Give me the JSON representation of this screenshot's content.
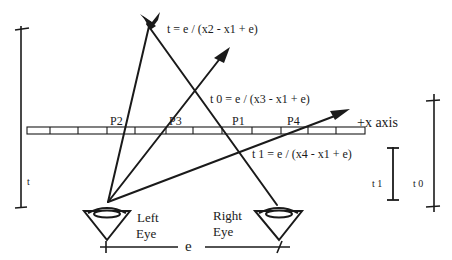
{
  "diagram": {
    "equations": {
      "t": "t = e / (x2 - x1 + e)",
      "t0": "t 0 = e / (x3 - x1 + e)",
      "t1": "t 1 = e / (x4 - x1 + e)"
    },
    "points": {
      "p2": "P2",
      "p3": "P3",
      "p1": "P1",
      "p4": "P4"
    },
    "axis_label": "+x axis",
    "dimensions": {
      "t": "t",
      "t1": "t 1",
      "t0": "t 0",
      "e": "e"
    },
    "eyes": {
      "left_line1": "Left",
      "left_line2": "Eye",
      "right_line1": "Right",
      "right_line2": "Eye"
    },
    "colors": {
      "ink": "#1a1a1a",
      "background": "#ffffff"
    }
  }
}
